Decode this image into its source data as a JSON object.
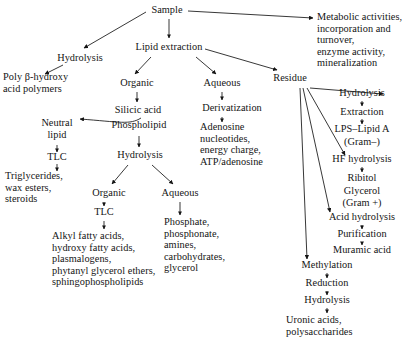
{
  "diagram": {
    "type": "flowchart",
    "background_color": "#ffffff",
    "line_color": "#141414",
    "nodes": {
      "sample": "Sample",
      "hydrolysis_left": "Hydrolysis",
      "poly_bhydroxy": "Poly β-hydroxy\nacid polymers",
      "lipid_extraction": "Lipid extraction",
      "organic_1": "Organic",
      "silicic_acid": "Silicic acid",
      "phospholipid": "Phospholipid",
      "neutral_lipid": "Neutral\nlipid",
      "tlc_1": "TLC",
      "triglycerides": "Triglycerides,\nwax esters,\nsteroids",
      "hydrolysis_2": "Hydrolysis",
      "organic_2": "Organic",
      "tlc_2": "TLC",
      "alkyl_fatty_acids": "Alkyl fatty acids,\nhydroxy fatty acids,\nplasmalogens,\nphytanyl glycerol ethers,\nsphingophospholipids",
      "aqueous_2": "Aqueous",
      "phosphate_list": "Phosphate,\nphosphonate,\namines,\ncarbohydrates,\nglycerol",
      "aqueous_1": "Aqueous",
      "derivatization": "Derivatization",
      "adenosine_list": "Adenosine\nnucleotides,\nenergy charge,\nATP/adenosine",
      "residue": "Residue",
      "metabolic_activities": "Metabolic activities,\nincorporation and\nturnover,\nenzyme activity,\nmineralization",
      "hydrolysis_3": "Hydrolysis",
      "extraction": "Extraction",
      "lps_lipid_a": "LPS–Lipid A",
      "gram_neg": "(Gram–)",
      "hf_hydrolysis": "HF hydrolysis",
      "ribitol": "Ribitol",
      "glycerol": "Glycerol",
      "gram_pos": "(Gram +)",
      "acid_hydrolysis": "Acid hydrolysis",
      "purification": "Purification",
      "muramic_acid": "Muramic acid",
      "methylation": "Methylation",
      "reduction": "Reduction",
      "hydrolysis_4": "Hydrolysis",
      "uronic_acids": "Uronic acids,\npolysaccharides"
    }
  }
}
